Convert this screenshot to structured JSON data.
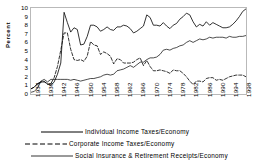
{
  "chart_data": {
    "type": "line",
    "title": "",
    "xlabel": "",
    "ylabel": "Percent",
    "ylim": [
      0,
      10
    ],
    "xlim": [
      1934,
      1999
    ],
    "grid": false,
    "legend_position": "bottom",
    "ytick_labels": [
      "10",
      "9",
      "8",
      "7",
      "6",
      "5",
      "4",
      "3",
      "2",
      "1",
      "0"
    ],
    "ytick_values": [
      10,
      9,
      8,
      7,
      6,
      5,
      4,
      3,
      2,
      1,
      0
    ],
    "xtick_labels": [
      "1934",
      "1938",
      "1942",
      "1946",
      "1950",
      "1954",
      "1958",
      "1962",
      "1966",
      "1970",
      "1974",
      "1978",
      "1982",
      "1986",
      "1990",
      "1994",
      "1998"
    ],
    "xtick_values": [
      1934,
      1938,
      1942,
      1946,
      1950,
      1954,
      1958,
      1962,
      1966,
      1970,
      1974,
      1978,
      1982,
      1986,
      1990,
      1994,
      1998
    ],
    "x": [
      1934,
      1935,
      1936,
      1937,
      1938,
      1939,
      1940,
      1941,
      1942,
      1943,
      1944,
      1945,
      1946,
      1947,
      1948,
      1949,
      1950,
      1951,
      1952,
      1953,
      1954,
      1955,
      1956,
      1957,
      1958,
      1959,
      1960,
      1961,
      1962,
      1963,
      1964,
      1965,
      1966,
      1967,
      1968,
      1969,
      1970,
      1971,
      1972,
      1973,
      1974,
      1975,
      1976,
      1977,
      1978,
      1979,
      1980,
      1981,
      1982,
      1983,
      1984,
      1985,
      1986,
      1987,
      1988,
      1989,
      1990,
      1991,
      1992,
      1993,
      1994,
      1995,
      1996,
      1997,
      1998,
      1999
    ],
    "series": [
      {
        "name": "Individual Income Taxes/Economy",
        "style": "solid",
        "color": "#000000",
        "values": [
          0.6,
          0.8,
          1.2,
          1.4,
          1.4,
          1.2,
          1.0,
          1.4,
          2.3,
          3.6,
          9.5,
          8.3,
          7.2,
          7.7,
          7.5,
          5.7,
          5.8,
          6.7,
          8.0,
          8.0,
          7.8,
          7.3,
          7.5,
          7.8,
          7.5,
          7.4,
          7.8,
          7.8,
          8.0,
          7.9,
          7.6,
          7.1,
          7.3,
          7.6,
          7.9,
          9.2,
          8.9,
          8.0,
          8.0,
          7.9,
          8.3,
          7.9,
          7.6,
          8.0,
          8.2,
          8.7,
          9.0,
          9.4,
          9.2,
          8.4,
          7.8,
          8.1,
          7.9,
          8.4,
          8.0,
          8.3,
          8.1,
          7.9,
          7.7,
          7.7,
          7.8,
          8.1,
          8.5,
          9.0,
          9.6,
          9.9
        ]
      },
      {
        "name": "Corporate Income Taxes/Economy",
        "style": "dashed",
        "color": "#000000",
        "values": [
          0.6,
          0.8,
          1.2,
          1.4,
          1.5,
          1.1,
          1.2,
          1.9,
          3.2,
          5.1,
          7.1,
          7.1,
          5.2,
          4.0,
          3.9,
          4.0,
          3.8,
          4.4,
          6.1,
          5.7,
          5.6,
          4.6,
          4.9,
          4.7,
          4.4,
          3.5,
          4.1,
          4.0,
          3.6,
          3.6,
          3.6,
          3.7,
          4.0,
          4.2,
          3.3,
          3.9,
          3.2,
          2.7,
          2.7,
          2.8,
          2.7,
          2.6,
          2.4,
          2.8,
          2.7,
          2.7,
          2.4,
          2.0,
          1.5,
          1.1,
          1.5,
          1.5,
          1.4,
          1.8,
          1.9,
          1.9,
          1.6,
          1.7,
          1.6,
          1.8,
          2.0,
          2.1,
          2.2,
          2.2,
          2.2,
          2.0
        ]
      },
      {
        "name": "Social Insurance & Retirement Receipts/Economy",
        "style": "solid-thin",
        "color": "#000000",
        "values": [
          0.2,
          0.3,
          0.7,
          1.5,
          1.7,
          1.4,
          1.7,
          1.7,
          1.7,
          1.7,
          1.7,
          1.7,
          1.6,
          1.7,
          1.6,
          1.5,
          1.6,
          1.7,
          1.8,
          1.8,
          1.9,
          2.0,
          2.2,
          2.3,
          2.2,
          2.3,
          2.7,
          2.8,
          2.9,
          3.1,
          3.3,
          3.1,
          3.4,
          3.7,
          3.7,
          4.0,
          4.2,
          4.2,
          4.3,
          4.6,
          5.1,
          5.2,
          5.1,
          5.3,
          5.4,
          5.6,
          5.7,
          6.0,
          6.2,
          6.0,
          6.2,
          6.4,
          6.3,
          6.4,
          6.6,
          6.5,
          6.6,
          6.6,
          6.6,
          6.5,
          6.7,
          6.6,
          6.6,
          6.7,
          6.7,
          6.8
        ]
      }
    ]
  },
  "legend": {
    "items": [
      {
        "label": "Individual Income Taxes/Economy",
        "style": "solid"
      },
      {
        "label": "Corporate Income Taxes/Economy",
        "style": "dashed"
      },
      {
        "label": "Social Insurance & Retirement Receipts/Economy",
        "style": "solid-thin"
      }
    ]
  },
  "axes": {
    "y_title": "Percent"
  }
}
